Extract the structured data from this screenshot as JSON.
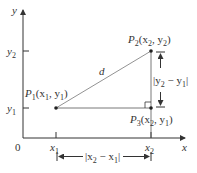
{
  "diagram": {
    "type": "distance-formula-figure",
    "axes": {
      "x_label": "x",
      "y_label": "y",
      "origin_label": "0",
      "x_ticks": [
        "x1",
        "x2"
      ],
      "y_ticks": [
        "y1",
        "y2"
      ]
    },
    "points": {
      "p1": {
        "name": "P",
        "sub": "1",
        "coords_text": "(x",
        "c1sub": "1",
        "mid": ", y",
        "c2sub": "1",
        "close": ")"
      },
      "p2": {
        "name": "P",
        "sub": "2",
        "coords_text": "(x",
        "c1sub": "2",
        "mid": ", y",
        "c2sub": "2",
        "close": ")"
      },
      "p3": {
        "name": "P",
        "sub": "3",
        "coords_text": "(x",
        "c1sub": "2",
        "mid": ", y",
        "c2sub": "1",
        "close": ")"
      }
    },
    "segments": {
      "hypotenuse_label": "d",
      "vertical_measure": {
        "pre": "|y",
        "s1": "2",
        "mid": " − y",
        "s2": "1",
        "post": "|"
      },
      "horizontal_measure": {
        "pre": "|x",
        "s1": "2",
        "mid": " − x",
        "s2": "1",
        "post": "|"
      }
    },
    "tick_labels": {
      "x1": {
        "base": "x",
        "sub": "1"
      },
      "x2": {
        "base": "x",
        "sub": "2"
      },
      "y1": {
        "base": "y",
        "sub": "1"
      },
      "y2": {
        "base": "y",
        "sub": "2"
      }
    },
    "colors": {
      "line": "#333333",
      "thin_line": "#777777",
      "text": "#333333"
    }
  }
}
